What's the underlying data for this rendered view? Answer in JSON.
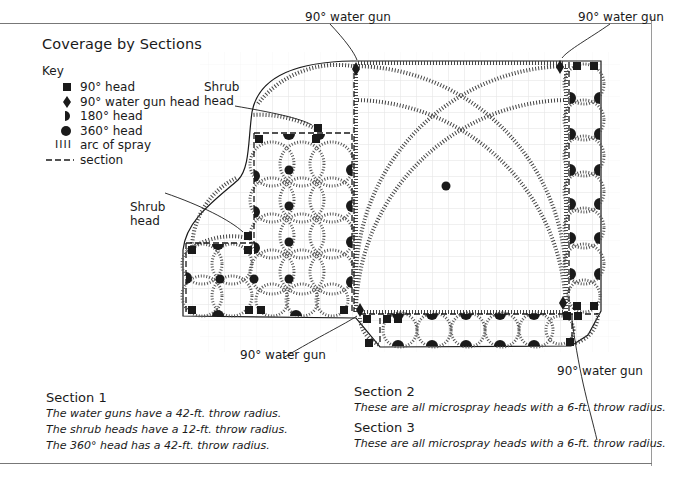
{
  "title": "Coverage by Sections",
  "key": {
    "label": "Key",
    "items": [
      {
        "symbol": "square-icon",
        "label": "90° head"
      },
      {
        "symbol": "diamond-icon",
        "label": "90° water gun head"
      },
      {
        "symbol": "half-circle-icon",
        "label": "180° head"
      },
      {
        "symbol": "circle-icon",
        "label": "360° head"
      },
      {
        "symbol": "spray-arc-icon",
        "glyph": "IIII",
        "label": "arc of spray"
      },
      {
        "symbol": "dashed-line-icon",
        "glyph": "– – –",
        "label": "section"
      }
    ]
  },
  "callouts": {
    "water_gun_top_left": "90° water gun",
    "water_gun_top_right": "90° water gun",
    "water_gun_bottom_left": "90° water gun",
    "water_gun_bottom_right": "90° water gun",
    "shrub_head_upper": "Shrub head",
    "shrub_head_lower": "Shrub head",
    "shrub_word": "Shrub",
    "head_word": "head"
  },
  "sections": [
    {
      "heading": "Section 1",
      "lines": [
        "The water guns have a 42-ft. throw radius.",
        "The shrub heads have a 12-ft. throw radius.",
        "The 360° head has a 42-ft. throw radius."
      ]
    },
    {
      "heading": "Section 2",
      "lines": [
        "These are all microspray heads with a 6-ft. throw radius."
      ]
    },
    {
      "heading": "Section 3",
      "lines": [
        "These are all microspray heads with a 6-ft. throw radius."
      ]
    }
  ],
  "colors": {
    "ink": "#1a1a1a",
    "grid": "#d9d9d9",
    "frame": "#777777"
  }
}
